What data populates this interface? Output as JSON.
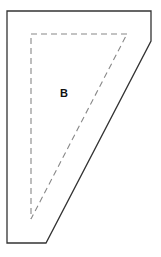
{
  "diagram": {
    "label": "B",
    "colors": {
      "outline": "#333333",
      "dashed": "#888888",
      "label": "#111111",
      "background": "#ffffff"
    },
    "outer_shape": {
      "points": [
        [
          7,
          11
        ],
        [
          151,
          11
        ],
        [
          151,
          41
        ],
        [
          46,
          243
        ],
        [
          7,
          243
        ]
      ],
      "style": "solid"
    },
    "inner_shape": {
      "points": [
        [
          31,
          34
        ],
        [
          127,
          34
        ],
        [
          31,
          219
        ]
      ],
      "style": "dashed"
    },
    "label_position": [
      64,
      93
    ]
  }
}
